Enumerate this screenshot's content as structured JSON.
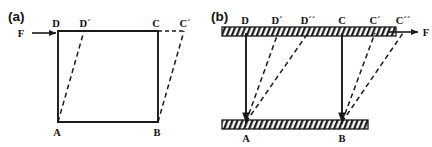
{
  "figure": {
    "width": 432,
    "height": 147,
    "background": "#ffffff",
    "stroke_color": "#1a1a1a",
    "dash_color": "#1a1a1a"
  },
  "panels": [
    {
      "id": "panel-a",
      "tag": "(a)",
      "tag_x": 8,
      "tag_y": 21,
      "description": "Shear deformation of a free block under force F",
      "force": {
        "label": "F",
        "label_x": 21,
        "label_y": 37,
        "arrow_x1": 32,
        "arrow_y1": 33,
        "arrow_x2": 58,
        "arrow_y2": 33
      },
      "solid_shape": {
        "points": "58,31 158,31 158,122 58,122",
        "closed": true
      },
      "vertices": [
        {
          "name": "D",
          "label": "D",
          "x": 58,
          "y": 31,
          "label_x": 56,
          "label_y": 27
        },
        {
          "name": "C",
          "label": "C",
          "x": 158,
          "y": 31,
          "label_x": 155,
          "label_y": 27
        },
        {
          "name": "A",
          "label": "A",
          "x": 58,
          "y": 122,
          "label_x": 55,
          "label_y": 135
        },
        {
          "name": "B",
          "label": "B",
          "x": 158,
          "y": 122,
          "label_x": 155,
          "label_y": 135
        },
        {
          "name": "Dp",
          "label": "D´",
          "x": 84,
          "y": 31,
          "label_x": 80,
          "label_y": 27
        },
        {
          "name": "Cp",
          "label": "C´",
          "x": 184,
          "y": 31,
          "label_x": 180,
          "label_y": 27
        }
      ],
      "dashed_lines": [
        {
          "name": "A-to-Dprime",
          "x1": 58,
          "y1": 122,
          "x2": 84,
          "y2": 31
        },
        {
          "name": "B-to-Cprime",
          "x1": 158,
          "y1": 122,
          "x2": 184,
          "y2": 31
        },
        {
          "name": "C-to-Cprime-top",
          "x1": 158,
          "y1": 31,
          "x2": 184,
          "y2": 31
        }
      ]
    },
    {
      "id": "panel-b",
      "tag": "(b)",
      "tag_x": 211,
      "tag_y": 21,
      "description": "Block constrained between two hatched rigid plates, two successive shear states",
      "force": {
        "label": "F",
        "label_x": 424,
        "label_y": 36,
        "arrow_x1": 396,
        "arrow_y1": 32,
        "arrow_x2": 420,
        "arrow_y2": 32
      },
      "hatched_bars": [
        {
          "name": "top-plate",
          "x": 222,
          "y": 27,
          "width": 174,
          "height": 9
        },
        {
          "name": "bottom-plate",
          "x": 222,
          "y": 120,
          "width": 146,
          "height": 9
        }
      ],
      "solid_verticals": [
        {
          "name": "D-to-A",
          "x1": 246,
          "y1": 33,
          "x2": 246,
          "y2": 122
        },
        {
          "name": "C-to-B",
          "x1": 342,
          "y1": 33,
          "x2": 342,
          "y2": 122
        }
      ],
      "vertices": [
        {
          "name": "D",
          "label": "D",
          "x": 246,
          "y": 33,
          "label_x": 242,
          "label_y": 24
        },
        {
          "name": "Dp",
          "label": "D´",
          "x": 278,
          "y": 33,
          "label_x": 273,
          "label_y": 24
        },
        {
          "name": "Dpp",
          "label": "D´´",
          "x": 308,
          "y": 33,
          "label_x": 302,
          "label_y": 24
        },
        {
          "name": "C",
          "label": "C",
          "x": 342,
          "y": 33,
          "label_x": 338,
          "label_y": 24
        },
        {
          "name": "Cp",
          "label": "C´",
          "x": 375,
          "y": 33,
          "label_x": 370,
          "label_y": 24
        },
        {
          "name": "Cpp",
          "label": "C´´",
          "x": 403,
          "y": 33,
          "label_x": 397,
          "label_y": 24
        },
        {
          "name": "A",
          "label": "A",
          "x": 246,
          "y": 122,
          "label_x": 242,
          "label_y": 141
        },
        {
          "name": "B",
          "label": "B",
          "x": 342,
          "y": 122,
          "label_x": 338,
          "label_y": 141
        }
      ],
      "dashed_lines": [
        {
          "name": "A-to-Dprime",
          "x1": 246,
          "y1": 122,
          "x2": 278,
          "y2": 33
        },
        {
          "name": "A-to-Dpprime",
          "x1": 246,
          "y1": 122,
          "x2": 308,
          "y2": 33
        },
        {
          "name": "B-to-Cprime",
          "x1": 342,
          "y1": 122,
          "x2": 375,
          "y2": 33
        },
        {
          "name": "B-to-Cpprime",
          "x1": 342,
          "y1": 122,
          "x2": 403,
          "y2": 33
        }
      ],
      "arrowheads_down": [
        {
          "name": "arrowhead-at-A",
          "x": 246,
          "y": 122
        },
        {
          "name": "arrowhead-at-B",
          "x": 342,
          "y": 122
        }
      ]
    }
  ]
}
